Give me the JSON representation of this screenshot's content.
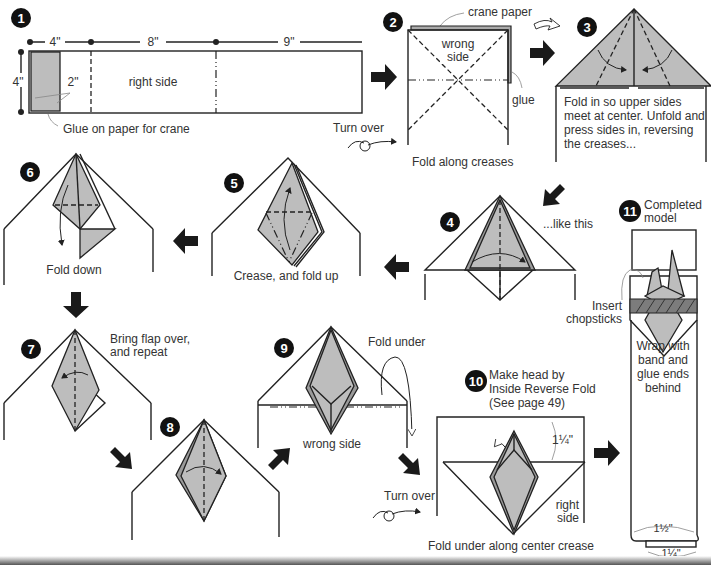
{
  "steps": [
    {
      "number": "1",
      "labels": {
        "dim_a": "4\"",
        "dim_b": "8\"",
        "dim_c": "9\"",
        "height": "4\"",
        "glue_width": "2\"",
        "face": "right side",
        "caption": "Glue on paper for crane"
      }
    },
    {
      "number": "2",
      "labels": {
        "crane_paper": "crane paper",
        "face_line1": "wrong",
        "face_line2": "side",
        "glue": "glue",
        "turn_over": "Turn over",
        "caption": "Fold along creases"
      }
    },
    {
      "number": "3",
      "labels": {
        "caption_line1": "Fold in so upper sides",
        "caption_line2": "meet at center. Unfold and",
        "caption_line3": "press sides in, reversing",
        "caption_line4": "the creases..."
      }
    },
    {
      "number": "4",
      "labels": {
        "caption": "...like this"
      }
    },
    {
      "number": "5",
      "labels": {
        "caption": "Crease, and fold up"
      }
    },
    {
      "number": "6",
      "labels": {
        "caption": "Fold down"
      }
    },
    {
      "number": "7",
      "labels": {
        "caption_line1": "Bring flap over,",
        "caption_line2": "and repeat"
      }
    },
    {
      "number": "8",
      "labels": {}
    },
    {
      "number": "9",
      "labels": {
        "fold_under": "Fold under",
        "face": "wrong side"
      }
    },
    {
      "number": "10",
      "labels": {
        "caption_line1": "Make head by",
        "caption_line2": "Inside Reverse Fold",
        "caption_line3": "(See page 49)",
        "dim": "1¼\"",
        "turn_over": "Turn over",
        "face_line1": "right",
        "face_line2": "side",
        "caption": "Fold under along center crease"
      }
    },
    {
      "number": "11",
      "labels": {
        "title_line1": "Completed",
        "title_line2": "model",
        "insert_line1": "Insert",
        "insert_line2": "chopsticks",
        "wrap_line1": "Wrap with",
        "wrap_line2": "band and",
        "wrap_line3": "glue ends",
        "wrap_line4": "behind",
        "dim_a": "1½\"",
        "dim_b": "1¼\""
      }
    }
  ],
  "colors": {
    "paper_gray": "#bdbdbd",
    "dark_gray": "#9a9a9a",
    "ink": "#222222"
  }
}
